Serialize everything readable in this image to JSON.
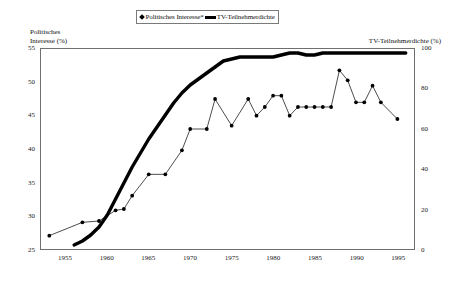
{
  "legend": {
    "entries": [
      {
        "label": "Politisches Interesse*",
        "marker": "diamond-line-marker",
        "color": "#000000"
      },
      {
        "label": "TV-Teilnehmerdichte",
        "marker": "thick-line-marker",
        "color": "#000000"
      }
    ]
  },
  "axes": {
    "left_title_line1": "Politisches",
    "left_title_line2": "Interesse (%)",
    "right_title": "TV-Teilnehmerdichte (%)",
    "left_ticks": [
      "55",
      "50",
      "45",
      "40",
      "35",
      "30",
      "25"
    ],
    "right_ticks": [
      "100",
      "80",
      "60",
      "40",
      "20",
      "0"
    ],
    "x_ticks": [
      "1955",
      "1960",
      "1965",
      "1970",
      "1975",
      "1980",
      "1985",
      "1990",
      "1995"
    ]
  },
  "chart_data": {
    "type": "line",
    "title": "",
    "xlabel": "",
    "ylabel": "Politisches Interesse (%)",
    "y2label": "TV-Teilnehmerdichte (%)",
    "xlim": [
      1952,
      1997
    ],
    "ylim": [
      25,
      55
    ],
    "y2lim": [
      0,
      100
    ],
    "grid": false,
    "legend_position": "top-center",
    "series": [
      {
        "name": "Politisches Interesse*",
        "axis": "left",
        "marker": "diamond",
        "line_width": "thin",
        "color": "#000000",
        "points": [
          {
            "x": 1953,
            "y": 27.0
          },
          {
            "x": 1957,
            "y": 29.0
          },
          {
            "x": 1959,
            "y": 29.2
          },
          {
            "x": 1961,
            "y": 30.8
          },
          {
            "x": 1962,
            "y": 31.0
          },
          {
            "x": 1963,
            "y": 33.0
          },
          {
            "x": 1965,
            "y": 36.2
          },
          {
            "x": 1967,
            "y": 36.2
          },
          {
            "x": 1969,
            "y": 39.8
          },
          {
            "x": 1970,
            "y": 43.0
          },
          {
            "x": 1972,
            "y": 43.0
          },
          {
            "x": 1973,
            "y": 47.5
          },
          {
            "x": 1975,
            "y": 43.5
          },
          {
            "x": 1977,
            "y": 47.5
          },
          {
            "x": 1978,
            "y": 45.0
          },
          {
            "x": 1979,
            "y": 46.3
          },
          {
            "x": 1980,
            "y": 48.0
          },
          {
            "x": 1981,
            "y": 48.0
          },
          {
            "x": 1982,
            "y": 45.0
          },
          {
            "x": 1983,
            "y": 46.3
          },
          {
            "x": 1984,
            "y": 46.3
          },
          {
            "x": 1985,
            "y": 46.3
          },
          {
            "x": 1986,
            "y": 46.3
          },
          {
            "x": 1987,
            "y": 46.3
          },
          {
            "x": 1988,
            "y": 51.8
          },
          {
            "x": 1989,
            "y": 50.3
          },
          {
            "x": 1990,
            "y": 47.0
          },
          {
            "x": 1991,
            "y": 47.0
          },
          {
            "x": 1992,
            "y": 49.5
          },
          {
            "x": 1993,
            "y": 47.0
          },
          {
            "x": 1995,
            "y": 44.5
          }
        ]
      },
      {
        "name": "TV-Teilnehmerdichte",
        "axis": "right",
        "marker": "none",
        "line_width": "thick",
        "color": "#000000",
        "points": [
          {
            "x": 1956,
            "y": 2
          },
          {
            "x": 1957,
            "y": 4
          },
          {
            "x": 1958,
            "y": 7
          },
          {
            "x": 1959,
            "y": 11
          },
          {
            "x": 1960,
            "y": 17
          },
          {
            "x": 1961,
            "y": 25
          },
          {
            "x": 1962,
            "y": 33
          },
          {
            "x": 1963,
            "y": 41
          },
          {
            "x": 1964,
            "y": 48
          },
          {
            "x": 1965,
            "y": 55
          },
          {
            "x": 1966,
            "y": 61
          },
          {
            "x": 1967,
            "y": 67
          },
          {
            "x": 1968,
            "y": 73
          },
          {
            "x": 1969,
            "y": 78
          },
          {
            "x": 1970,
            "y": 82
          },
          {
            "x": 1971,
            "y": 85
          },
          {
            "x": 1972,
            "y": 88
          },
          {
            "x": 1973,
            "y": 91
          },
          {
            "x": 1974,
            "y": 94
          },
          {
            "x": 1975,
            "y": 95
          },
          {
            "x": 1976,
            "y": 96
          },
          {
            "x": 1977,
            "y": 96
          },
          {
            "x": 1978,
            "y": 96
          },
          {
            "x": 1979,
            "y": 96
          },
          {
            "x": 1980,
            "y": 96
          },
          {
            "x": 1981,
            "y": 97
          },
          {
            "x": 1982,
            "y": 98
          },
          {
            "x": 1983,
            "y": 98
          },
          {
            "x": 1984,
            "y": 97
          },
          {
            "x": 1985,
            "y": 97
          },
          {
            "x": 1986,
            "y": 98
          },
          {
            "x": 1987,
            "y": 98
          },
          {
            "x": 1988,
            "y": 98
          },
          {
            "x": 1989,
            "y": 98
          },
          {
            "x": 1990,
            "y": 98
          },
          {
            "x": 1991,
            "y": 98
          },
          {
            "x": 1992,
            "y": 98
          },
          {
            "x": 1993,
            "y": 98
          },
          {
            "x": 1994,
            "y": 98
          },
          {
            "x": 1995,
            "y": 98
          },
          {
            "x": 1996,
            "y": 98
          }
        ]
      }
    ]
  }
}
